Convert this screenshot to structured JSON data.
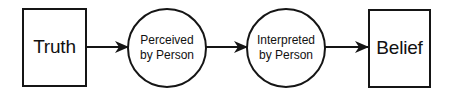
{
  "diagram": {
    "type": "flowchart",
    "direction": "left-to-right",
    "colors": {
      "stroke": "#151515",
      "text": "#111111",
      "background": "#ffffff"
    },
    "nodes": [
      {
        "id": "truth",
        "shape": "rectangle",
        "label": "Truth"
      },
      {
        "id": "perceived",
        "shape": "circle",
        "label_line1": "Perceived",
        "label_line2": "by Person"
      },
      {
        "id": "interpreted",
        "shape": "circle",
        "label_line1": "Interpreted",
        "label_line2": "by Person"
      },
      {
        "id": "belief",
        "shape": "rectangle",
        "label": "Belief"
      }
    ],
    "edges": [
      {
        "from": "truth",
        "to": "perceived",
        "style": "arrow"
      },
      {
        "from": "perceived",
        "to": "interpreted",
        "style": "arrow"
      },
      {
        "from": "interpreted",
        "to": "belief",
        "style": "arrow"
      }
    ]
  }
}
